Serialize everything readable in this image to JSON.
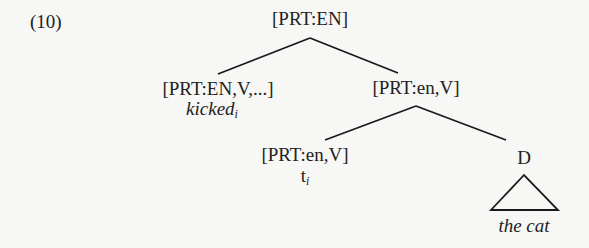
{
  "example_number": "(10)",
  "tree": {
    "root": {
      "label": "[PRT:EN]"
    },
    "left_child": {
      "label": "[PRT:EN,V,...]",
      "word": "kicked",
      "index": "i"
    },
    "right_child": {
      "label": "[PRT:en,V]"
    },
    "right_left_child": {
      "label": "[PRT:en,V]",
      "word": "t",
      "index": "i"
    },
    "right_right_child": {
      "label": "D",
      "word": "the cat",
      "triangle": true
    }
  },
  "edges": [
    [
      "root",
      "left_child"
    ],
    [
      "root",
      "right_child"
    ],
    [
      "right_child",
      "right_left_child"
    ],
    [
      "right_child",
      "right_right_child"
    ]
  ]
}
